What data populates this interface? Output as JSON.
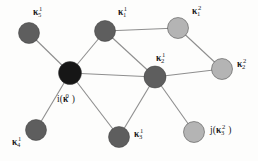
{
  "figure": {
    "type": "graph-diagram",
    "width": 258,
    "height": 161,
    "background_color": "#fdfdfc",
    "edge_color": "#8e8e8e",
    "label_color": "#1b1b1b"
  },
  "colors": {
    "center_node": "#161616",
    "shell1_node": "#5e5e5e",
    "shell2_node": "#b4b4b4",
    "node_stroke": "#3a3a3a"
  },
  "nodes": [
    {
      "id": "center",
      "data_name": "node-center",
      "label_text": "i(κ⁰)",
      "label_base": "i(",
      "label_kappa": "κ",
      "label_sub": "",
      "label_sup": "0",
      "label_close": ")",
      "shell": "center",
      "color": "#161616",
      "cx": 70,
      "cy": 73,
      "r": 11.5,
      "label_x": 57,
      "label_y": 95
    },
    {
      "id": "k5_1",
      "data_name": "node-kappa-5-1",
      "label_text": "κ₅¹",
      "label_base": "",
      "label_kappa": "κ",
      "label_sub": "5",
      "label_sup": "1",
      "label_close": "",
      "shell": "shell1",
      "color": "#5e5e5e",
      "cx": 29,
      "cy": 33,
      "r": 10.5,
      "label_x": 33,
      "label_y": 8
    },
    {
      "id": "k1_1",
      "data_name": "node-kappa-1-1",
      "label_text": "κ₁¹",
      "label_base": "",
      "label_kappa": "κ",
      "label_sub": "1",
      "label_sup": "1",
      "label_close": "",
      "shell": "shell1",
      "color": "#5e5e5e",
      "cx": 105,
      "cy": 31,
      "r": 10.5,
      "label_x": 118,
      "label_y": 8
    },
    {
      "id": "k2_1",
      "data_name": "node-kappa-2-1",
      "label_text": "κ₂¹",
      "label_base": "",
      "label_kappa": "κ",
      "label_sub": "2",
      "label_sup": "1",
      "label_close": "",
      "shell": "shell1",
      "color": "#5e5e5e",
      "cx": 155,
      "cy": 77,
      "r": 11,
      "label_x": 156,
      "label_y": 54
    },
    {
      "id": "k4_1",
      "data_name": "node-kappa-4-1",
      "label_text": "κ₄¹",
      "label_base": "",
      "label_kappa": "κ",
      "label_sub": "4",
      "label_sup": "1",
      "label_close": "",
      "shell": "shell1",
      "color": "#5e5e5e",
      "cx": 36,
      "cy": 130,
      "r": 10.5,
      "label_x": 12,
      "label_y": 138
    },
    {
      "id": "k3_1",
      "data_name": "node-kappa-3-1",
      "label_text": "κ₃¹",
      "label_base": "",
      "label_kappa": "κ",
      "label_sub": "3",
      "label_sup": "1",
      "label_close": "",
      "shell": "shell1",
      "color": "#5e5e5e",
      "cx": 119,
      "cy": 137,
      "r": 10.5,
      "label_x": 134,
      "label_y": 130
    },
    {
      "id": "k1_2",
      "data_name": "node-kappa-1-2",
      "label_text": "κ₁²",
      "label_base": "",
      "label_kappa": "κ",
      "label_sub": "1",
      "label_sup": "2",
      "label_close": "",
      "shell": "shell2",
      "color": "#b4b4b4",
      "cx": 178,
      "cy": 28,
      "r": 10.5,
      "label_x": 192,
      "label_y": 7
    },
    {
      "id": "k2_2",
      "data_name": "node-kappa-2-2",
      "label_text": "κ₂²",
      "label_base": "",
      "label_kappa": "κ",
      "label_sub": "2",
      "label_sup": "2",
      "label_close": "",
      "shell": "shell2",
      "color": "#b4b4b4",
      "cx": 222,
      "cy": 69,
      "r": 10.5,
      "label_x": 237,
      "label_y": 60
    },
    {
      "id": "k3_2",
      "data_name": "node-kappa-3-2",
      "label_text": "j(κ₃²)",
      "label_base": "j(",
      "label_kappa": "κ",
      "label_sub": "3",
      "label_sup": "2",
      "label_close": ")",
      "shell": "shell2",
      "color": "#b4b4b4",
      "cx": 194,
      "cy": 132,
      "r": 10.5,
      "label_x": 210,
      "label_y": 126
    }
  ],
  "edges": [
    {
      "data_name": "edge-center-kappa-5-1",
      "from": "center",
      "to": "k5_1",
      "x1": 70,
      "y1": 73,
      "x2": 29,
      "y2": 33
    },
    {
      "data_name": "edge-center-kappa-1-1",
      "from": "center",
      "to": "k1_1",
      "x1": 70,
      "y1": 73,
      "x2": 105,
      "y2": 31
    },
    {
      "data_name": "edge-center-kappa-4-1",
      "from": "center",
      "to": "k4_1",
      "x1": 70,
      "y1": 73,
      "x2": 36,
      "y2": 130
    },
    {
      "data_name": "edge-center-kappa-3-1",
      "from": "center",
      "to": "k3_1",
      "x1": 70,
      "y1": 73,
      "x2": 119,
      "y2": 137
    },
    {
      "data_name": "edge-center-kappa-2-1",
      "from": "center",
      "to": "k2_1",
      "x1": 70,
      "y1": 73,
      "x2": 155,
      "y2": 77
    },
    {
      "data_name": "edge-kappa-1-1-kappa-2-1",
      "from": "k1_1",
      "to": "k2_1",
      "x1": 105,
      "y1": 31,
      "x2": 155,
      "y2": 77
    },
    {
      "data_name": "edge-kappa-1-1-kappa-1-2",
      "from": "k1_1",
      "to": "k1_2",
      "x1": 105,
      "y1": 31,
      "x2": 178,
      "y2": 28
    },
    {
      "data_name": "edge-kappa-1-2-kappa-2-2",
      "from": "k1_2",
      "to": "k2_2",
      "x1": 178,
      "y1": 28,
      "x2": 222,
      "y2": 69
    },
    {
      "data_name": "edge-kappa-2-1-kappa-2-2",
      "from": "k2_1",
      "to": "k2_2",
      "x1": 155,
      "y1": 77,
      "x2": 222,
      "y2": 69
    },
    {
      "data_name": "edge-kappa-2-1-kappa-3-1",
      "from": "k2_1",
      "to": "k3_1",
      "x1": 155,
      "y1": 77,
      "x2": 119,
      "y2": 137
    },
    {
      "data_name": "edge-kappa-2-1-kappa-3-2",
      "from": "k2_1",
      "to": "k3_2",
      "x1": 155,
      "y1": 77,
      "x2": 194,
      "y2": 132
    }
  ]
}
